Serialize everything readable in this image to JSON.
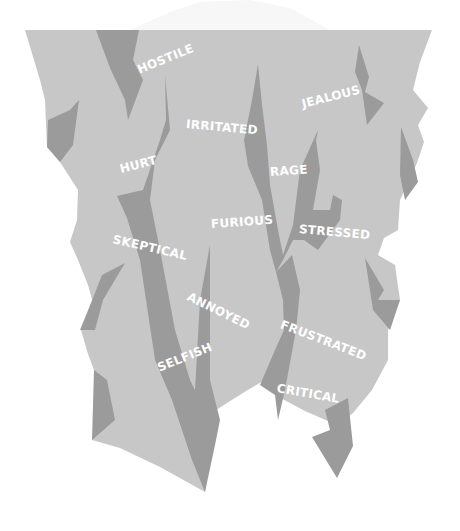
{
  "diagram": {
    "type": "anger-iceberg",
    "colors": {
      "background": "#ffffff",
      "tip": "#f7f7f7",
      "body": "#c7c7c7",
      "cracks": "#9b9b9b",
      "text": "#ffffff"
    },
    "labels": [
      {
        "text": "HOSTILE",
        "x": 138,
        "y": 64,
        "rotate": -22
      },
      {
        "text": "IRRITATED",
        "x": 186,
        "y": 118,
        "rotate": 5
      },
      {
        "text": "JEALOUS",
        "x": 302,
        "y": 98,
        "rotate": -14
      },
      {
        "text": "HURT",
        "x": 120,
        "y": 163,
        "rotate": -14
      },
      {
        "text": "RAGE",
        "x": 270,
        "y": 166,
        "rotate": -4
      },
      {
        "text": "FURIOUS",
        "x": 211,
        "y": 218,
        "rotate": -4
      },
      {
        "text": "STRESSED",
        "x": 299,
        "y": 223,
        "rotate": 5
      },
      {
        "text": "SKEPTICAL",
        "x": 113,
        "y": 233,
        "rotate": 13
      },
      {
        "text": "ANNOYED",
        "x": 188,
        "y": 290,
        "rotate": 26
      },
      {
        "text": "FRUSTRATED",
        "x": 281,
        "y": 318,
        "rotate": 21
      },
      {
        "text": "SELFISH",
        "x": 158,
        "y": 362,
        "rotate": -22
      },
      {
        "text": "CRITICAL",
        "x": 277,
        "y": 382,
        "rotate": 10
      }
    ]
  }
}
